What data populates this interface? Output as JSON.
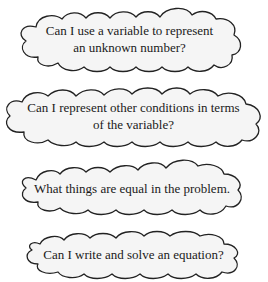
{
  "diagram": {
    "type": "question-clouds",
    "clouds": [
      {
        "text": "Can I use a variable to represent\nan unknown number?"
      },
      {
        "text": "Can I represent other conditions in terms\nof the variable?"
      },
      {
        "text": "What things are equal in the problem."
      },
      {
        "text": "Can I write and solve an equation?"
      }
    ],
    "colors": {
      "cloud_fill": "#f5f5f5",
      "cloud_stroke": "#222222",
      "text": "#1a1a1a"
    }
  }
}
